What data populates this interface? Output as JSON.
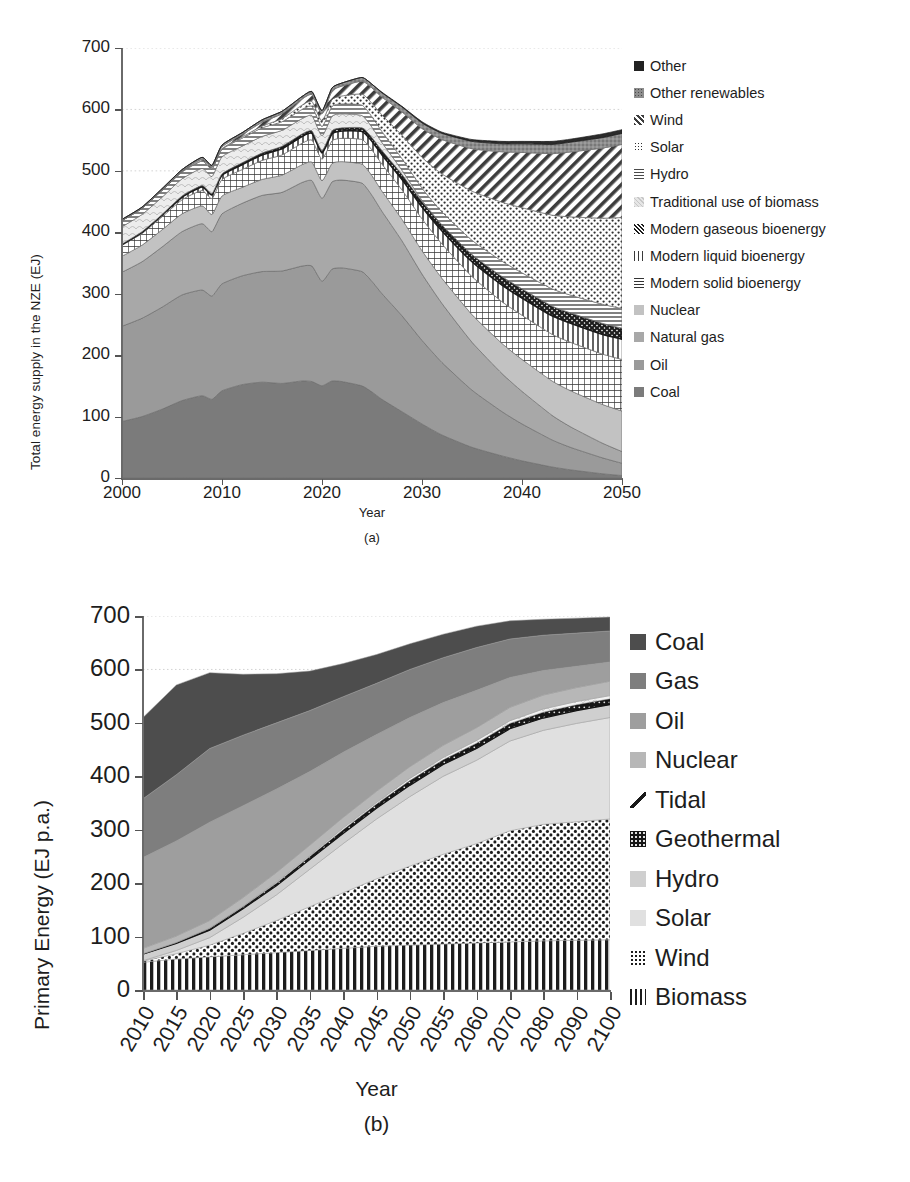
{
  "figure": {
    "subcaption_a": "(a)",
    "subcaption_b": "(b)",
    "footer_note": ""
  },
  "chart_data": [
    {
      "id": "chart-a",
      "type": "area",
      "title": "",
      "subcaption": "(a)",
      "xlabel": "Year",
      "ylabel": "Total energy supply in the NZE (EJ)",
      "xlim": [
        2000,
        2050
      ],
      "ylim": [
        0,
        700
      ],
      "yticks": [
        0,
        100,
        200,
        300,
        400,
        500,
        600,
        700
      ],
      "xticks": [
        2000,
        2010,
        2020,
        2030,
        2040,
        2050
      ],
      "grid": true,
      "legend_position": "right",
      "stacked": true,
      "x": [
        2000,
        2002,
        2004,
        2006,
        2008,
        2009,
        2010,
        2012,
        2014,
        2016,
        2018,
        2019,
        2020,
        2021,
        2022,
        2024,
        2025,
        2026,
        2028,
        2030,
        2032,
        2035,
        2038,
        2040,
        2043,
        2045,
        2048,
        2050
      ],
      "series": [
        {
          "name": "Coal",
          "pattern": "solid",
          "color": "#7b7b7b",
          "values": [
            92,
            100,
            112,
            126,
            134,
            128,
            142,
            152,
            156,
            154,
            158,
            157,
            150,
            158,
            157,
            150,
            140,
            128,
            108,
            88,
            70,
            50,
            36,
            28,
            18,
            13,
            7,
            4
          ]
        },
        {
          "name": "Oil",
          "pattern": "solid",
          "color": "#9a9a9a",
          "values": [
            155,
            160,
            166,
            172,
            172,
            168,
            174,
            177,
            180,
            183,
            187,
            188,
            170,
            182,
            185,
            186,
            180,
            172,
            156,
            136,
            118,
            93,
            72,
            60,
            44,
            36,
            26,
            20
          ]
        },
        {
          "name": "Natural gas",
          "pattern": "solid",
          "color": "#a8a8a8",
          "values": [
            88,
            92,
            98,
            103,
            108,
            105,
            114,
            118,
            124,
            128,
            136,
            139,
            135,
            142,
            143,
            144,
            140,
            134,
            122,
            108,
            96,
            78,
            62,
            53,
            40,
            33,
            24,
            19
          ]
        },
        {
          "name": "Nuclear",
          "pattern": "solid",
          "color": "#c2c2c2",
          "values": [
            26,
            27,
            28,
            29,
            29,
            28,
            29,
            26,
            26,
            28,
            29,
            30,
            29,
            30,
            30,
            31,
            32,
            33,
            35,
            38,
            41,
            45,
            49,
            52,
            56,
            59,
            63,
            66
          ]
        },
        {
          "name": "Modern solid bioenergy",
          "pattern": "grid",
          "color": "#ffffff",
          "values": [
            18,
            19,
            21,
            23,
            25,
            26,
            27,
            29,
            31,
            33,
            35,
            36,
            35,
            37,
            38,
            40,
            42,
            44,
            48,
            52,
            56,
            62,
            68,
            72,
            76,
            79,
            82,
            84
          ]
        },
        {
          "name": "Modern liquid bioenergy",
          "pattern": "vline",
          "color": "#ffffff",
          "values": [
            1,
            2,
            3,
            4,
            6,
            6,
            7,
            8,
            9,
            10,
            11,
            11,
            10,
            11,
            12,
            13,
            14,
            15,
            17,
            19,
            21,
            24,
            27,
            28,
            30,
            31,
            32,
            33
          ]
        },
        {
          "name": "Modern gaseous bioenergy",
          "pattern": "cross-dense",
          "color": "#3a3a3a",
          "values": [
            1,
            1,
            1,
            2,
            2,
            2,
            2,
            3,
            3,
            4,
            4,
            4,
            4,
            5,
            5,
            6,
            6,
            7,
            8,
            9,
            10,
            12,
            14,
            15,
            16,
            17,
            18,
            18
          ]
        },
        {
          "name": "Traditional use of biomass",
          "pattern": "light-curve",
          "color": "#e8e8e8",
          "values": [
            28,
            28,
            28,
            28,
            28,
            28,
            28,
            27,
            27,
            26,
            25,
            25,
            24,
            24,
            23,
            20,
            17,
            13,
            7,
            2,
            0,
            0,
            0,
            0,
            0,
            0,
            0,
            0
          ]
        },
        {
          "name": "Hydro",
          "pattern": "hline",
          "color": "#d0d0d0",
          "values": [
            10,
            10,
            11,
            11,
            12,
            12,
            12,
            13,
            14,
            14,
            15,
            15,
            15,
            16,
            16,
            17,
            17,
            18,
            19,
            20,
            21,
            23,
            25,
            26,
            28,
            29,
            31,
            32
          ]
        },
        {
          "name": "Solar",
          "pattern": "dots",
          "color": "#ffffff",
          "values": [
            0,
            0,
            0,
            1,
            1,
            1,
            1,
            2,
            3,
            5,
            7,
            8,
            9,
            11,
            13,
            18,
            22,
            27,
            38,
            50,
            62,
            80,
            96,
            106,
            120,
            128,
            140,
            148
          ]
        },
        {
          "name": "Wind",
          "pattern": "diag",
          "color": "#ffffff",
          "values": [
            0,
            0,
            1,
            1,
            2,
            2,
            3,
            4,
            6,
            8,
            10,
            11,
            12,
            14,
            16,
            21,
            25,
            29,
            38,
            47,
            56,
            69,
            82,
            90,
            100,
            106,
            114,
            119
          ]
        },
        {
          "name": "Other renewables",
          "pattern": "grey-dots",
          "color": "#8f8f8f",
          "values": [
            2,
            2,
            2,
            2,
            3,
            3,
            3,
            3,
            4,
            4,
            4,
            5,
            5,
            5,
            5,
            6,
            6,
            7,
            8,
            9,
            10,
            12,
            13,
            14,
            15,
            16,
            17,
            18
          ]
        },
        {
          "name": "Other",
          "pattern": "dark-solid",
          "color": "#2b2b2b",
          "values": [
            0,
            0,
            0,
            0,
            0,
            0,
            0,
            0,
            0,
            0,
            0,
            0,
            0,
            0,
            0,
            0,
            0,
            1,
            1,
            2,
            2,
            3,
            4,
            4,
            5,
            5,
            6,
            6
          ]
        }
      ],
      "legend": [
        {
          "label": "Other",
          "swatch": "dark-solid"
        },
        {
          "label": "Other renewables",
          "swatch": "grey-dots"
        },
        {
          "label": "Wind",
          "swatch": "diag"
        },
        {
          "label": "Solar",
          "swatch": "dots"
        },
        {
          "label": "Hydro",
          "swatch": "hline"
        },
        {
          "label": "Traditional use of biomass",
          "swatch": "light-curve"
        },
        {
          "label": "Modern gaseous bioenergy",
          "swatch": "cross-dense"
        },
        {
          "label": "Modern liquid bioenergy",
          "swatch": "vline"
        },
        {
          "label": "Modern solid bioenergy",
          "swatch": "grid"
        },
        {
          "label": "Nuclear",
          "swatch": "nuclear-grey"
        },
        {
          "label": "Natural gas",
          "swatch": "gas-grey"
        },
        {
          "label": "Oil",
          "swatch": "oil-grey"
        },
        {
          "label": "Coal",
          "swatch": "coal-grey"
        }
      ]
    },
    {
      "id": "chart-b",
      "type": "area",
      "title": "",
      "subcaption": "(b)",
      "xlabel": "Year",
      "ylabel": "Primary Energy (EJ p.a.)",
      "ylim": [
        0,
        700
      ],
      "yticks": [
        0,
        100,
        200,
        300,
        400,
        500,
        600,
        700
      ],
      "xticks": [
        "2010",
        "2015",
        "2020",
        "2025",
        "2030",
        "2035",
        "2040",
        "2045",
        "2050",
        "2055",
        "2060",
        "2070",
        "2080",
        "2090",
        "2100"
      ],
      "grid": true,
      "legend_position": "right",
      "stacked": true,
      "x": [
        "2010",
        "2015",
        "2020",
        "2025",
        "2030",
        "2035",
        "2040",
        "2045",
        "2050",
        "2055",
        "2060",
        "2070",
        "2080",
        "2090",
        "2100"
      ],
      "series": [
        {
          "name": "Biomass",
          "pattern": "vline",
          "color": "#ffffff",
          "values": [
            52,
            58,
            62,
            66,
            70,
            74,
            78,
            82,
            84,
            86,
            88,
            90,
            92,
            93,
            94
          ]
        },
        {
          "name": "Wind",
          "pattern": "dots",
          "color": "#ffffff",
          "values": [
            2,
            10,
            22,
            40,
            60,
            82,
            104,
            126,
            148,
            168,
            186,
            208,
            218,
            222,
            226
          ]
        },
        {
          "name": "Solar",
          "pattern": "solid",
          "color": "#e0e0e0",
          "values": [
            1,
            6,
            14,
            30,
            48,
            70,
            92,
            112,
            130,
            146,
            156,
            168,
            176,
            184,
            190
          ]
        },
        {
          "name": "Hydro",
          "pattern": "solid",
          "color": "#cfcfcf",
          "values": [
            12,
            13,
            14,
            16,
            17,
            18,
            19,
            20,
            21,
            22,
            22,
            23,
            23,
            24,
            24
          ]
        },
        {
          "name": "Geothermal",
          "pattern": "dark-dots",
          "color": "#1e1e1e",
          "values": [
            1,
            2,
            3,
            4,
            5,
            6,
            7,
            8,
            9,
            9,
            10,
            10,
            11,
            11,
            11
          ]
        },
        {
          "name": "Tidal",
          "pattern": "light-curve",
          "color": "#f0f0f0",
          "values": [
            0,
            0,
            1,
            1,
            2,
            2,
            3,
            3,
            4,
            4,
            5,
            5,
            6,
            6,
            6
          ]
        },
        {
          "name": "Nuclear",
          "pattern": "solid",
          "color": "#b7b7b7",
          "values": [
            10,
            12,
            14,
            16,
            18,
            19,
            20,
            21,
            22,
            23,
            24,
            25,
            26,
            26,
            27
          ]
        },
        {
          "name": "Oil",
          "pattern": "solid",
          "color": "#9e9e9e",
          "values": [
            170,
            178,
            184,
            172,
            156,
            138,
            122,
            106,
            92,
            80,
            70,
            56,
            46,
            40,
            36
          ]
        },
        {
          "name": "Gas",
          "pattern": "solid",
          "color": "#7e7e7e",
          "values": [
            110,
            124,
            138,
            132,
            124,
            114,
            104,
            96,
            90,
            84,
            80,
            72,
            66,
            62,
            58
          ]
        },
        {
          "name": "Coal",
          "pattern": "solid",
          "color": "#4d4d4d",
          "values": [
            152,
            168,
            142,
            114,
            92,
            74,
            62,
            54,
            48,
            44,
            40,
            34,
            30,
            28,
            26
          ]
        }
      ],
      "legend": [
        {
          "label": "Coal",
          "swatch": "coal-dark"
        },
        {
          "label": "Gas",
          "swatch": "gas-dark"
        },
        {
          "label": "Oil",
          "swatch": "oil-mid"
        },
        {
          "label": "Nuclear",
          "swatch": "nuclear-mid"
        },
        {
          "label": "Tidal",
          "swatch": "tidal-curve"
        },
        {
          "label": "Geothermal",
          "swatch": "geo-dark"
        },
        {
          "label": "Hydro",
          "swatch": "hydro-light"
        },
        {
          "label": "Solar",
          "swatch": "solar-light"
        },
        {
          "label": "Wind",
          "swatch": "wind-dots"
        },
        {
          "label": "Biomass",
          "swatch": "biomass-vline"
        }
      ]
    }
  ]
}
